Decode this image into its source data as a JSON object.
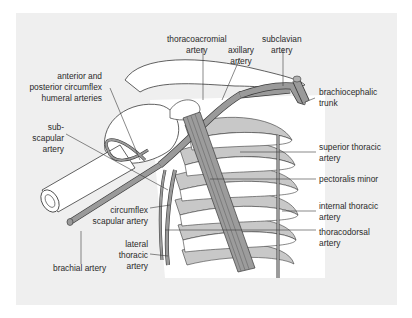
{
  "diagram": {
    "colors": {
      "background": "#ffffff",
      "panel": "#efefef",
      "artery": "#9a9a9a",
      "rib_shade": "#c4c4c4",
      "outline": "#3a3a3a",
      "text": "#2a2a2a"
    },
    "labels": {
      "thoracoacromial": "thoracoacromial\nartery",
      "axillary": "axillary\nartery",
      "subclavian": "subclavian\nartery",
      "brachiocephalic": "brachiocephalic\ntrunk",
      "circumflex_humeral": "anterior and\nposterior circumflex\nhumeral arteries",
      "subscapular": "sub-\nscapular\nartery",
      "superior_thoracic": "superior thoracic\nartery",
      "pectoralis_minor": "pectoralis minor",
      "internal_thoracic": "internal thoracic\nartery",
      "thoracodorsal": "thoracodorsal\nartery",
      "circumflex_scapular": "circumflex\nscapular artery",
      "lateral_thoracic": "lateral\nthoracic\nartery",
      "brachial": "brachial artery"
    }
  }
}
